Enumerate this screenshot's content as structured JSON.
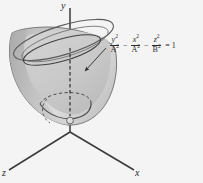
{
  "figure": {
    "background_color": "#f4f4f4",
    "surface_fill": "#c9c9c9",
    "surface_stroke": "#555555",
    "axis_color": "#3a3a3a",
    "text_color": "#2b2b2b",
    "axes": {
      "y_label": "y",
      "x_label": "x",
      "z_label": "z"
    },
    "equation": {
      "term1": {
        "numerator": "y",
        "numerator_power": "2",
        "denominator": "A",
        "denominator_power": "2"
      },
      "operator1": "−",
      "term2": {
        "numerator": "x",
        "numerator_power": "2",
        "denominator": "A",
        "denominator_power": "2"
      },
      "operator2": "−",
      "term3": {
        "numerator": "z",
        "numerator_power": "2",
        "denominator": "B",
        "denominator_power": "2"
      },
      "equals": "=",
      "rhs": "1",
      "plain_text": "y²/A² − x²/A² − z²/B² = 1"
    },
    "annotations": {
      "leader_arrow": "arrow-from-equation-to-surface",
      "vertex_marker": "vertex-point-on-y-axis",
      "hidden_edge_style": "dashed"
    }
  }
}
